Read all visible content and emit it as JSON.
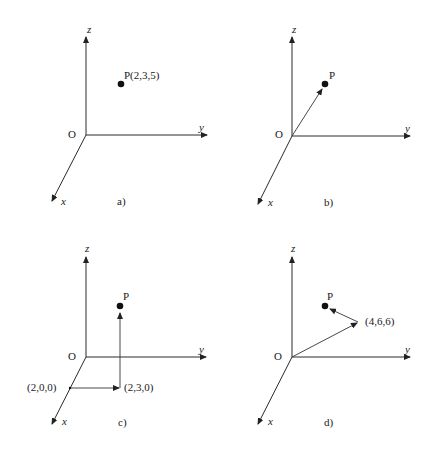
{
  "figure": {
    "panels": [
      {
        "id": "a",
        "caption": "a)",
        "axis_labels": {
          "x": "x",
          "y": "y",
          "z": "z",
          "origin": "O"
        },
        "point": {
          "label": "P(2,3,5)",
          "coords": [
            2,
            3,
            5
          ]
        },
        "construction": "point only",
        "extra_labels": []
      },
      {
        "id": "b",
        "caption": "b)",
        "axis_labels": {
          "x": "x",
          "y": "y",
          "z": "z",
          "origin": "O"
        },
        "point": {
          "label": "P",
          "coords": [
            2,
            3,
            5
          ]
        },
        "construction": "position vector from O to P",
        "extra_labels": []
      },
      {
        "id": "c",
        "caption": "c)",
        "axis_labels": {
          "x": "x",
          "y": "y",
          "z": "z",
          "origin": "O"
        },
        "point": {
          "label": "P",
          "coords": [
            2,
            3,
            5
          ]
        },
        "construction": "path (2,0,0) -> (2,3,0) -> P",
        "extra_labels": [
          "(2,0,0)",
          "(2,3,0)"
        ]
      },
      {
        "id": "d",
        "caption": "d)",
        "axis_labels": {
          "x": "x",
          "y": "y",
          "z": "z",
          "origin": "O"
        },
        "point": {
          "label": "P",
          "coords": [
            2,
            3,
            5
          ]
        },
        "construction": "vector O -> (4,6,6) then (4,6,6) -> P",
        "extra_labels": [
          "(4,6,6)"
        ]
      }
    ]
  }
}
